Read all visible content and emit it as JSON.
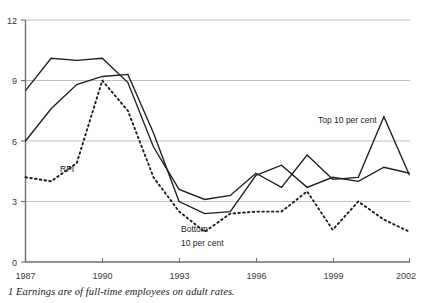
{
  "chart_data": {
    "type": "line",
    "title": "",
    "subtitle": "",
    "xlabel": "",
    "ylabel": "",
    "xlim": [
      1987,
      2002
    ],
    "ylim": [
      0,
      12
    ],
    "yticks": [
      0,
      3,
      6,
      9,
      12
    ],
    "xticks": [
      1987,
      1990,
      1993,
      1996,
      1999,
      2002
    ],
    "xtick_labels": [
      "1987",
      "1990",
      "1993",
      "1996",
      "1999",
      "2002"
    ],
    "ytick_labels": [
      "0",
      "3",
      "6",
      "9",
      "12"
    ],
    "grid": "horizontal",
    "legend": "inline-annotations",
    "x": [
      1987,
      1988,
      1989,
      1990,
      1991,
      1992,
      1993,
      1994,
      1995,
      1996,
      1997,
      1998,
      1999,
      2000,
      2001,
      2002
    ],
    "series": [
      {
        "name": "Top 10 per cent",
        "style": "solid",
        "values": [
          8.5,
          10.1,
          10.0,
          10.1,
          8.9,
          5.7,
          3.6,
          3.1,
          3.3,
          4.4,
          3.7,
          5.3,
          4.1,
          4.2,
          7.2,
          4.3
        ]
      },
      {
        "name": "Bottom 10 per cent",
        "style": "solid",
        "values": [
          6.0,
          7.6,
          8.8,
          9.2,
          9.3,
          6.4,
          3.0,
          2.4,
          2.5,
          4.3,
          4.8,
          3.7,
          4.2,
          4.0,
          4.7,
          4.4
        ]
      },
      {
        "name": "RPI",
        "style": "dotted",
        "values": [
          4.2,
          4.0,
          4.9,
          9.0,
          7.5,
          4.2,
          2.5,
          1.5,
          2.4,
          2.5,
          2.5,
          3.5,
          1.6,
          3.0,
          2.1,
          1.5
        ]
      }
    ],
    "annotations": [
      {
        "text": "RPI",
        "x": 1989.0,
        "y": 4.45
      },
      {
        "text": "Bottom",
        "x": 1994.0,
        "y": 1.75
      },
      {
        "text": "10 per cent",
        "x": 1994.0,
        "y": 1.05
      },
      {
        "text": "Top 10 per cent",
        "x": 1999.3,
        "y": 6.55
      }
    ]
  },
  "footnote": {
    "text": "1 Earnings are of full-time employees on adult rates."
  },
  "colors": {
    "series_line": "#1d1d1d",
    "gridline": "#b9b9b9",
    "axis": "#6d6d6d",
    "text": "#1a1a1a",
    "background": "#ffffff"
  }
}
